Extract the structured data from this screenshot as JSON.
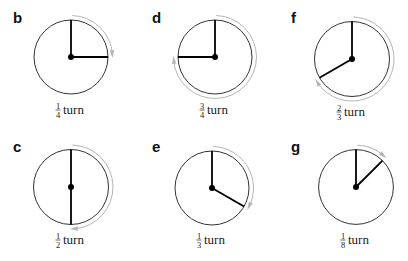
{
  "figure": {
    "type": "turn-diagrams",
    "rotation_direction": "clockwise",
    "start_direction": "up",
    "colors": {
      "dial": "#333333",
      "hand": "#000000",
      "arrow": "#b5b5b5",
      "text": "#222222"
    },
    "panels": [
      {
        "id": "b",
        "letter": "b",
        "numerator": "1",
        "denominator": "4",
        "word": "turn",
        "fraction": 0.25,
        "cx": 71,
        "cy": 57,
        "r": 37,
        "letter_x": 13,
        "letter_y": 23,
        "label_y": 110
      },
      {
        "id": "d",
        "letter": "d",
        "numerator": "3",
        "denominator": "4",
        "word": "turn",
        "fraction": 0.75,
        "cx": 215,
        "cy": 57,
        "r": 37,
        "letter_x": 152,
        "letter_y": 23,
        "label_y": 110
      },
      {
        "id": "f",
        "letter": "f",
        "numerator": "2",
        "denominator": "3",
        "word": "turn",
        "fraction": 0.6667,
        "cx": 352,
        "cy": 59,
        "r": 37.5,
        "letter_x": 291,
        "letter_y": 23,
        "label_y": 112
      },
      {
        "id": "c",
        "letter": "c",
        "numerator": "1",
        "denominator": "2",
        "word": "turn",
        "fraction": 0.5,
        "cx": 71,
        "cy": 187,
        "r": 37.5,
        "letter_x": 13,
        "letter_y": 152,
        "label_y": 240
      },
      {
        "id": "e",
        "letter": "e",
        "numerator": "1",
        "denominator": "3",
        "word": "turn",
        "fraction": 0.3333,
        "cx": 212,
        "cy": 188,
        "r": 37,
        "letter_x": 152,
        "letter_y": 152,
        "label_y": 240
      },
      {
        "id": "g",
        "letter": "g",
        "numerator": "1",
        "denominator": "8",
        "word": "turn",
        "fraction": 0.125,
        "cx": 356,
        "cy": 187,
        "r": 37.4,
        "letter_x": 291,
        "letter_y": 152,
        "label_y": 240
      }
    ]
  }
}
